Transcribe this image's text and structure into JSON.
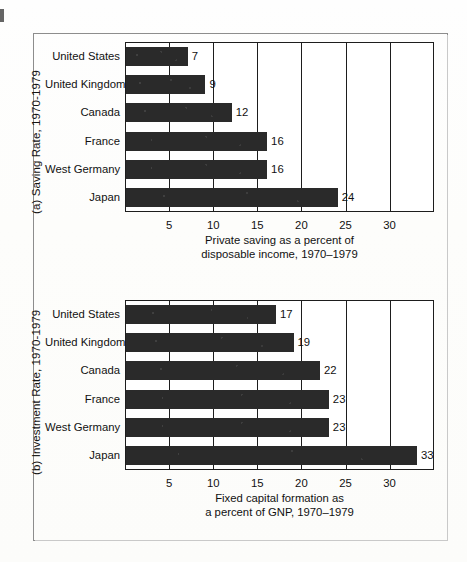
{
  "figure": {
    "background": "#fdfdfc",
    "frame_color": "#8d8d8d",
    "bar_color": "#2a2a2a"
  },
  "chart_data": [
    {
      "type": "bar",
      "orientation": "horizontal",
      "panel_id": "(a)",
      "title": "(a)  Saving Rate, 1970-1979",
      "side_label": "(a)  Saving Rate, 1970-1979",
      "categories": [
        "United States",
        "United Kingdom",
        "Canada",
        "France",
        "West Germany",
        "Japan"
      ],
      "values": [
        7,
        9,
        12,
        16,
        16,
        24
      ],
      "value_labels": [
        "7",
        "9",
        "12",
        "16",
        "16",
        "24"
      ],
      "xlabel_line1": "Private saving as a percent of",
      "xlabel_line2": "disposable income, 1970–1979",
      "ylabel": "",
      "xticks": [
        5,
        10,
        15,
        20,
        25,
        30
      ],
      "xtick_labels": [
        "5",
        "10",
        "15",
        "20",
        "25",
        "30"
      ],
      "xlim": [
        0,
        35
      ],
      "grid": "vertical"
    },
    {
      "type": "bar",
      "orientation": "horizontal",
      "panel_id": "(b)",
      "title": "(b)  Investment Rate, 1970-1979",
      "side_label": "(b)  Investment Rate, 1970-1979",
      "categories": [
        "United States",
        "United Kingdom",
        "Canada",
        "France",
        "West Germany",
        "Japan"
      ],
      "values": [
        17,
        19,
        22,
        23,
        23,
        33
      ],
      "value_labels": [
        "17",
        "19",
        "22",
        "23",
        "23",
        "33"
      ],
      "xlabel_line1": "Fixed capital formation as",
      "xlabel_line2": "a percent of GNP, 1970–1979",
      "ylabel": "",
      "xticks": [
        5,
        10,
        15,
        20,
        25,
        30
      ],
      "xtick_labels": [
        "5",
        "10",
        "15",
        "20",
        "25",
        "30"
      ],
      "xlim": [
        0,
        35
      ],
      "grid": "vertical"
    }
  ]
}
